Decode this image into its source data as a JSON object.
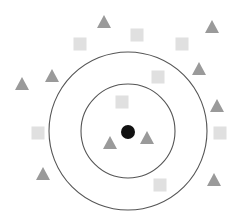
{
  "diagram": {
    "type": "k-nearest-neighbors illustration",
    "query_point": {
      "x": 128,
      "y": 132,
      "r": 7,
      "color": "#111111"
    },
    "circles": [
      {
        "name": "inner-neighborhood-circle",
        "cx": 128,
        "cy": 131,
        "r": 47,
        "color": "#555555"
      },
      {
        "name": "outer-neighborhood-circle",
        "cx": 128,
        "cy": 131,
        "r": 79,
        "color": "#555555"
      }
    ],
    "triangle_color": "#9a9a9a",
    "square_color": "#e0e0e0",
    "triangles": [
      {
        "x": 104,
        "y": 22
      },
      {
        "x": 212,
        "y": 27
      },
      {
        "x": 52,
        "y": 76
      },
      {
        "x": 22,
        "y": 84
      },
      {
        "x": 199,
        "y": 69
      },
      {
        "x": 217,
        "y": 106
      },
      {
        "x": 110,
        "y": 143
      },
      {
        "x": 147,
        "y": 138
      },
      {
        "x": 43,
        "y": 174
      },
      {
        "x": 214,
        "y": 180
      }
    ],
    "squares": [
      {
        "x": 80,
        "y": 44
      },
      {
        "x": 137,
        "y": 35
      },
      {
        "x": 182,
        "y": 44
      },
      {
        "x": 158,
        "y": 77
      },
      {
        "x": 122,
        "y": 102
      },
      {
        "x": 38,
        "y": 133
      },
      {
        "x": 220,
        "y": 133
      },
      {
        "x": 160,
        "y": 185
      }
    ]
  }
}
